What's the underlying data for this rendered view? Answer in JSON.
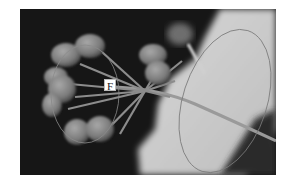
{
  "figure": {
    "label": "F",
    "colors": {
      "background": "#151515",
      "bract": "#cfcfcf",
      "fruit": "#8a8a8a",
      "stalk": "#9a9a9a",
      "annotation": "#7a7a7a",
      "page": "#ffffff"
    },
    "annotations": [
      {
        "name": "fruit-cluster-ellipse",
        "shape": "ellipse"
      },
      {
        "name": "bract-ellipse",
        "shape": "ellipse"
      }
    ]
  }
}
